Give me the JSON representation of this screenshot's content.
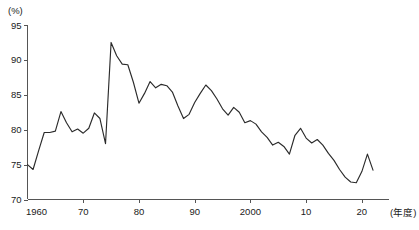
{
  "chart_data": {
    "type": "line",
    "title": "",
    "subtitle": "",
    "xlabel": "(年度)",
    "ylabel": "(%)",
    "xlim": [
      1960,
      2022
    ],
    "ylim": [
      70,
      95
    ],
    "grid": false,
    "legend": null,
    "y_ticks": [
      70,
      75,
      80,
      85,
      90,
      95
    ],
    "y_tick_labels": [
      "70",
      "75",
      "80",
      "85",
      "90",
      "95"
    ],
    "x_ticks": [
      1960,
      1970,
      1980,
      1990,
      2000,
      2010,
      2020
    ],
    "x_tick_labels": [
      "1960",
      "70",
      "80",
      "90",
      "2000",
      "10",
      "20"
    ],
    "series": [
      {
        "name": "",
        "color": "#2b2b2b",
        "x": [
          1960,
          1961,
          1962,
          1963,
          1964,
          1965,
          1966,
          1967,
          1968,
          1969,
          1970,
          1971,
          1972,
          1973,
          1974,
          1975,
          1976,
          1977,
          1978,
          1979,
          1980,
          1981,
          1982,
          1983,
          1984,
          1985,
          1986,
          1987,
          1988,
          1989,
          1990,
          1991,
          1992,
          1993,
          1994,
          1995,
          1996,
          1997,
          1998,
          1999,
          2000,
          2001,
          2002,
          2003,
          2004,
          2005,
          2006,
          2007,
          2008,
          2009,
          2010,
          2011,
          2012,
          2013,
          2014,
          2015,
          2016,
          2017,
          2018,
          2019,
          2020,
          2021,
          2022
        ],
        "values": [
          75.0,
          74.3,
          77.0,
          79.6,
          79.6,
          79.8,
          82.6,
          81.0,
          79.7,
          80.1,
          79.5,
          80.2,
          82.4,
          81.6,
          78.0,
          92.5,
          90.6,
          89.4,
          89.3,
          86.8,
          83.8,
          85.2,
          86.9,
          86.0,
          86.5,
          86.3,
          85.4,
          83.4,
          81.6,
          82.2,
          83.9,
          85.2,
          86.4,
          85.6,
          84.4,
          83.0,
          82.1,
          83.2,
          82.5,
          81.0,
          81.3,
          80.8,
          79.7,
          78.9,
          77.8,
          78.2,
          77.6,
          76.5,
          79.2,
          80.2,
          78.8,
          78.1,
          78.6,
          77.8,
          76.6,
          75.6,
          74.3,
          73.2,
          72.5,
          72.4,
          74.0,
          76.5,
          74.2
        ]
      }
    ]
  },
  "axes": {
    "y_unit_label": "(%)",
    "x_unit_label": "(年度)"
  }
}
